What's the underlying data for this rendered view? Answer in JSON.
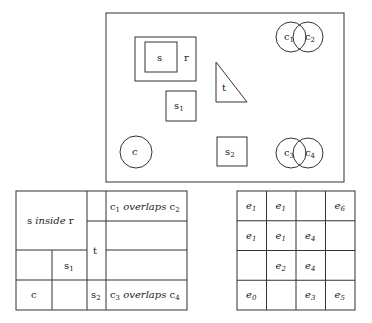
{
  "scene": {
    "frame": {
      "x": 106,
      "y": 13,
      "w": 238,
      "h": 169
    },
    "rect_r": {
      "label": "r",
      "x": 135,
      "y": 37,
      "w": 61,
      "h": 44
    },
    "square_s": {
      "label": "s",
      "x": 145,
      "y": 42,
      "w": 32,
      "h": 30
    },
    "square_s1": {
      "label": "s",
      "sub": "1",
      "x": 166,
      "y": 91,
      "w": 30,
      "h": 30
    },
    "triangle_t": {
      "label": "t",
      "points": "216,62 216,102 247,102"
    },
    "circle_c": {
      "label": "c",
      "cx": 136,
      "cy": 152,
      "r": 16
    },
    "square_s2": {
      "label": "s",
      "sub": "2",
      "x": 217,
      "y": 137,
      "w": 30,
      "h": 29
    },
    "circle_c1": {
      "label": "c",
      "sub": "1",
      "cx": 291,
      "cy": 37,
      "r": 15
    },
    "circle_c2": {
      "label": "c",
      "sub": "2",
      "cx": 308,
      "cy": 37,
      "r": 15
    },
    "circle_c3": {
      "label": "c",
      "sub": "3",
      "cx": 291,
      "cy": 153,
      "r": 15
    },
    "circle_c4": {
      "label": "c",
      "sub": "4",
      "cx": 308,
      "cy": 153,
      "r": 15
    }
  },
  "left_table": {
    "s_inside_r": {
      "a": "s",
      "mid": "inside",
      "b": "r"
    },
    "s1": {
      "a": "s",
      "sub": "1"
    },
    "c": "c",
    "t": "t",
    "s2": {
      "a": "s",
      "sub": "2"
    },
    "c1_overlaps_c2": {
      "a": "c",
      "asub": "1",
      "mid": "overlaps",
      "b": "c",
      "bsub": "2"
    },
    "c3_overlaps_c4": {
      "a": "c",
      "asub": "3",
      "mid": "overlaps",
      "b": "c",
      "bsub": "4"
    }
  },
  "right_grid": {
    "rows": [
      [
        {
          "b": "e",
          "s": "1"
        },
        {
          "b": "e",
          "s": "1"
        },
        {
          "b": "",
          "s": ""
        },
        {
          "b": "e",
          "s": "6"
        }
      ],
      [
        {
          "b": "e",
          "s": "1"
        },
        {
          "b": "e",
          "s": "1"
        },
        {
          "b": "e",
          "s": "4"
        },
        {
          "b": "",
          "s": ""
        }
      ],
      [
        {
          "b": "",
          "s": ""
        },
        {
          "b": "e",
          "s": "2"
        },
        {
          "b": "e",
          "s": "4"
        },
        {
          "b": "",
          "s": ""
        }
      ],
      [
        {
          "b": "e",
          "s": "0"
        },
        {
          "b": "",
          "s": ""
        },
        {
          "b": "e",
          "s": "3"
        },
        {
          "b": "e",
          "s": "5"
        }
      ]
    ]
  }
}
